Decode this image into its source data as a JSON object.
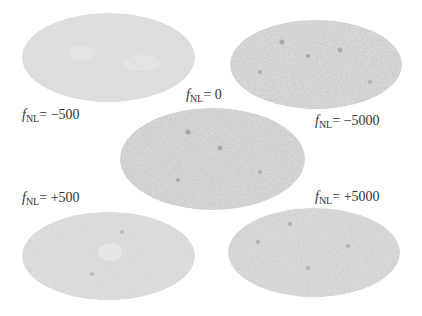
{
  "figure": {
    "maps": [
      {
        "id": "fnl-neg500",
        "label_prefix": "f",
        "label_sub": "NL",
        "label_value": "= −500",
        "fill": "#dcdcdc",
        "speckle": "#cfcfcf",
        "dark": "#bdbdbd"
      },
      {
        "id": "fnl-0",
        "label_prefix": "f",
        "label_sub": "NL",
        "label_value": "= 0",
        "fill": "#d7d7d7",
        "speckle": "#c4c4c4",
        "dark": "#9a9a9a"
      },
      {
        "id": "fnl-neg5000",
        "label_prefix": "f",
        "label_sub": "NL",
        "label_value": "= −5000",
        "fill": "#d6d6d6",
        "speckle": "#c2c2c2",
        "dark": "#959595"
      },
      {
        "id": "fnl-pos500",
        "label_prefix": "f",
        "label_sub": "NL",
        "label_value": "= +500",
        "fill": "#dddddd",
        "speckle": "#cbcbcb",
        "dark": "#a8a8a8"
      },
      {
        "id": "fnl-pos5000",
        "label_prefix": "f",
        "label_sub": "NL",
        "label_value": "= +5000",
        "fill": "#d9d9d9",
        "speckle": "#c6c6c6",
        "dark": "#a0a0a0"
      }
    ]
  }
}
